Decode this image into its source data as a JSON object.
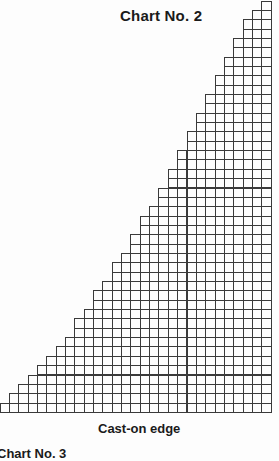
{
  "title": "Chart No. 2",
  "caption": "Cast-on edge",
  "next_title": "Chart No. 3",
  "grid": {
    "columns": 29,
    "rows": 44,
    "cell_px": 9.35,
    "line_color": "#3a3a3a",
    "row_widths_top_to_bottom": [
      1,
      2,
      3,
      3,
      4,
      4,
      5,
      5,
      6,
      6,
      7,
      7,
      8,
      8,
      9,
      9,
      10,
      10,
      11,
      11,
      12,
      12,
      13,
      14,
      14,
      15,
      15,
      16,
      17,
      17,
      18,
      19,
      19,
      20,
      21,
      21,
      22,
      23,
      24,
      25,
      26,
      27,
      28,
      29
    ]
  }
}
